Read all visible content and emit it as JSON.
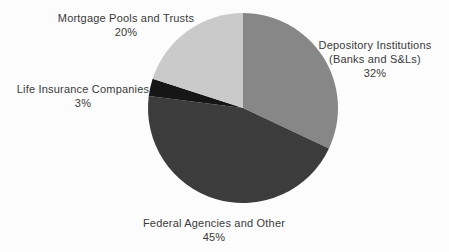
{
  "chart_data": {
    "type": "pie",
    "title": "",
    "start_angle_deg": 0,
    "direction": "clockwise",
    "legend": "none",
    "labels_position": "outside",
    "slices": [
      {
        "id": "depository",
        "label": "Depository Institutions (Banks and S&Ls)",
        "value": 32,
        "pct_label": "32%",
        "color": "#878787"
      },
      {
        "id": "federal",
        "label": "Federal Agencies and Other",
        "value": 45,
        "pct_label": "45%",
        "color": "#3c3c3c"
      },
      {
        "id": "life",
        "label": "Life Insurance Companies",
        "value": 3,
        "pct_label": "3%",
        "color": "#161616"
      },
      {
        "id": "mortgage",
        "label": "Mortgage Pools and Trusts",
        "value": 20,
        "pct_label": "20%",
        "color": "#cacaca"
      }
    ]
  },
  "labels": {
    "mortgage": {
      "lines": [
        "Mortgage Pools and Trusts",
        "20%"
      ]
    },
    "depository": {
      "lines": [
        "Depository Institutions",
        "(Banks and S&Ls)",
        "32%"
      ]
    },
    "life": {
      "lines": [
        "Life Insurance Companies",
        "3%"
      ]
    },
    "federal": {
      "lines": [
        "Federal Agencies and Other",
        "45%"
      ]
    }
  }
}
